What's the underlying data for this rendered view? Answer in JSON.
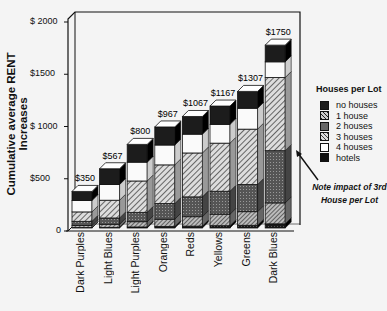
{
  "chart_data": {
    "type": "bar",
    "stacked": true,
    "title": "",
    "xlabel": "",
    "ylabel": "Cumulative average RENT Increases",
    "ylim": [
      0,
      2000
    ],
    "yticks": [
      "0",
      "$500",
      "$ 1000",
      "$1500",
      "$ 2000"
    ],
    "ytick_values": [
      0,
      500,
      1000,
      1500,
      2000
    ],
    "categories": [
      "Dark Purples",
      "Light Blues",
      "Light Purples",
      "Oranges",
      "Reds",
      "Yellows",
      "Greens",
      "Dark Blues"
    ],
    "totals": [
      350,
      567,
      800,
      967,
      1067,
      1167,
      1307,
      1750
    ],
    "total_labels": [
      "$350",
      "$567",
      "$800",
      "$967",
      "$1067",
      "$1167",
      "$1307",
      "$1750"
    ],
    "legend_title": "Houses per Lot",
    "legend_position": "right",
    "series": [
      {
        "name": "no houses",
        "values": [
          4,
          6,
          10,
          14,
          18,
          22,
          26,
          40
        ]
      },
      {
        "name": "1 house",
        "values": [
          20,
          30,
          50,
          70,
          90,
          110,
          130,
          200
        ]
      },
      {
        "name": "2 houses",
        "values": [
          40,
          60,
          90,
          150,
          190,
          220,
          260,
          500
        ]
      },
      {
        "name": "3 houses",
        "values": [
          90,
          170,
          300,
          370,
          420,
          460,
          530,
          700
        ]
      },
      {
        "name": "4 houses",
        "values": [
          110,
          150,
          180,
          190,
          180,
          180,
          200,
          150
        ]
      },
      {
        "name": "hotels",
        "values": [
          86,
          151,
          170,
          173,
          169,
          175,
          161,
          160
        ]
      }
    ],
    "annotation": "Note impact of 3rd House per Lot",
    "grid": false
  },
  "legend": {
    "title": "Houses per Lot",
    "items": [
      "no houses",
      "1 house",
      "2 houses",
      "3 houses",
      "4 houses",
      "hotels"
    ]
  },
  "annotation": {
    "line1": "Note impact of 3rd",
    "line2": "House per Lot"
  }
}
